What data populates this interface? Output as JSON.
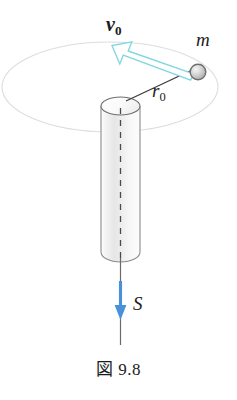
{
  "figure": {
    "caption_kanji": "図",
    "caption_number": "9.8",
    "caption_full": "図 9.8"
  },
  "labels": {
    "velocity": {
      "symbol": "v",
      "subscript": "0",
      "bold": true
    },
    "mass": {
      "symbol": "m",
      "subscript": ""
    },
    "radius": {
      "symbol": "r",
      "subscript": "0"
    },
    "tension": {
      "symbol": "S",
      "subscript": ""
    }
  },
  "colors": {
    "velocity_arrow_stroke": "#7fd8e3",
    "velocity_arrow_fill": "#ffffff",
    "tension_arrow": "#4a90d9",
    "axis_line": "#6b6b6b",
    "cylinder_outline": "#707070",
    "orbit_path": "#dcdcdc",
    "radius_line": "#3a3a3a",
    "ball_outline": "#6e6e6e",
    "ball_fill": "#cfcfcf",
    "text": "#1c1c1c",
    "background": "#ffffff"
  },
  "geometry": {
    "ball_center_x": 198,
    "ball_center_y": 72,
    "ball_radius": 8,
    "cylinder_top_y": 98,
    "cylinder_bottom_y": 262,
    "cylinder_left_x": 101,
    "cylinder_right_x": 140,
    "axis_x": 120,
    "axis_bottom_y": 345,
    "orbit_center_x": 110,
    "orbit_center_y": 87,
    "orbit_radius_x": 108,
    "orbit_radius_y": 45
  },
  "icons": {
    "velocity_arrow": "arrow-up-left-outlined",
    "tension_arrow": "arrow-down-solid",
    "point_mass": "sphere-icon",
    "cylinder": "cylinder-icon",
    "orbit": "ellipse-orbit-icon"
  }
}
